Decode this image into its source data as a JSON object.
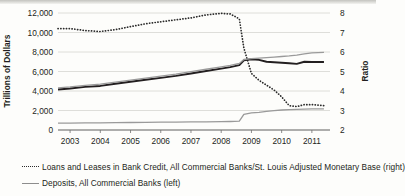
{
  "chart_data": {
    "type": "line",
    "title": "",
    "xlabel": "",
    "ylabel": "Trillions of Dollars",
    "y2label": "Ratio",
    "grid": true,
    "legend_position": "bottom-left",
    "x": [
      2002.6,
      2003.0,
      2003.5,
      2004.0,
      2004.5,
      2005.0,
      2005.5,
      2006.0,
      2006.5,
      2007.0,
      2007.5,
      2008.0,
      2008.3,
      2008.6,
      2008.75,
      2009.0,
      2009.25,
      2009.5,
      2009.75,
      2010.0,
      2010.25,
      2010.5,
      2010.75,
      2011.0,
      2011.4
    ],
    "xticks": [
      "2003",
      "2004",
      "2005",
      "2006",
      "2007",
      "2008",
      "2009",
      "2010",
      "2011"
    ],
    "yticks_left": [
      "0",
      "2,000",
      "4,000",
      "6,000",
      "8,000",
      "10,000",
      "12,000"
    ],
    "yticks_right": [
      "2",
      "3",
      "4",
      "5",
      "6",
      "7",
      "8"
    ],
    "ylim_left": [
      0,
      12000
    ],
    "ylim_right": [
      2,
      8
    ],
    "series": [
      {
        "name": "Loans and Leases in Bank Credit, All Commercial Banks/St. Louis Adjusted Monetary Base (right)",
        "short_name": "loans-to-monetary-base-ratio",
        "axis": "right",
        "style": "dotted",
        "color": "#2b2b2b",
        "values": [
          7.2,
          7.2,
          7.1,
          7.05,
          7.15,
          7.3,
          7.45,
          7.55,
          7.65,
          7.75,
          7.9,
          7.98,
          7.95,
          7.7,
          6.2,
          4.9,
          4.55,
          4.3,
          4.05,
          3.7,
          3.25,
          3.2,
          3.3,
          3.3,
          3.25
        ]
      },
      {
        "name": "Deposits, All Commercial Banks (left)",
        "short_name": "deposits-all-commercial-banks",
        "axis": "left",
        "style": "solid",
        "color": "#231f20",
        "values": [
          4150,
          4250,
          4420,
          4520,
          4750,
          4950,
          5150,
          5350,
          5550,
          5800,
          6050,
          6300,
          6450,
          6650,
          7150,
          7250,
          7200,
          7000,
          6950,
          6900,
          6850,
          6780,
          7000,
          6980,
          6980
        ]
      },
      {
        "name": "Bank credit upper gray line (left)",
        "short_name": "bank-credit-line",
        "axis": "left",
        "style": "solid",
        "color": "#9a9a9a",
        "values": [
          4320,
          4420,
          4580,
          4700,
          4920,
          5120,
          5320,
          5520,
          5720,
          5980,
          6230,
          6480,
          6620,
          6820,
          7230,
          7320,
          7380,
          7430,
          7480,
          7540,
          7600,
          7680,
          7800,
          7900,
          7960
        ]
      },
      {
        "name": "St. Louis Adjusted Monetary Base (left)",
        "short_name": "monetary-base-line",
        "axis": "left",
        "style": "solid",
        "color": "#9a9a9a",
        "values": [
          700,
          710,
          725,
          740,
          755,
          770,
          785,
          800,
          812,
          825,
          840,
          855,
          870,
          900,
          1600,
          1750,
          1800,
          1900,
          1980,
          2050,
          2100,
          2120,
          2150,
          2160,
          2160
        ]
      }
    ]
  },
  "axes": {
    "left_title": "Trillions of Dollars",
    "right_title": "Ratio"
  },
  "legend": {
    "items": [
      {
        "key": "dotted",
        "label": "Loans and Leases in Bank Credit, All Commercial Banks/St. Louis Adjusted Monetary Base (right)"
      },
      {
        "key": "solid",
        "label": "Deposits, All Commercial Banks (left)"
      }
    ]
  }
}
